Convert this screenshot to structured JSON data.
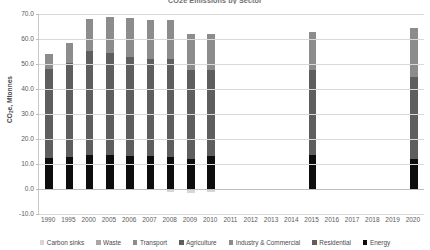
{
  "chart_data": {
    "type": "bar",
    "subtype": "stacked-column",
    "title": "CO2e Emissions by Sector",
    "xlabel": "",
    "ylabel": "CO₂e, Mtonnes",
    "ylim": [
      -10.0,
      70.0
    ],
    "ytick_step": 10.0,
    "ytick_labels": [
      "70.0",
      "60.0",
      "50.0",
      "40.0",
      "30.0",
      "20.0",
      "10.0",
      "0.0",
      "-10.0"
    ],
    "ytick_values": [
      70.0,
      60.0,
      50.0,
      40.0,
      30.0,
      20.0,
      10.0,
      0.0,
      -10.0
    ],
    "grid": true,
    "grid_axis": "y",
    "legend_position": "bottom",
    "categories": [
      "1990",
      "1995",
      "2000",
      "2005",
      "2006",
      "2007",
      "2008",
      "2009",
      "2010",
      "2011",
      "2012",
      "2013",
      "2014",
      "2015",
      "2016",
      "2017",
      "2018",
      "2019",
      "2020"
    ],
    "series": [
      {
        "name": "Energy",
        "color": "#0d0d0d",
        "values": [
          12.4,
          13.0,
          13.6,
          13.6,
          13.4,
          13.1,
          13.0,
          12.2,
          13.4,
          null,
          null,
          null,
          null,
          13.5,
          null,
          null,
          null,
          null,
          11.9
        ]
      },
      {
        "name": "Residential",
        "color": "#5e5e5e",
        "values": [
          35.6,
          37.3,
          41.8,
          40.9,
          39.6,
          38.9,
          38.9,
          35.4,
          34.3,
          null,
          null,
          null,
          null,
          34.3,
          null,
          null,
          null,
          null,
          33.0
        ]
      },
      {
        "name": "Industry & Commercial",
        "color": "#8c8c8c",
        "values": [
          6.2,
          8.1,
          12.7,
          14.4,
          15.4,
          15.7,
          15.7,
          14.5,
          14.4,
          null,
          null,
          null,
          null,
          15.0,
          null,
          null,
          null,
          null,
          19.4
        ]
      },
      {
        "name": "Agriculture",
        "color": "#5e5e5e",
        "values": [
          0,
          0,
          0,
          0,
          0,
          0,
          0,
          0,
          0,
          null,
          null,
          null,
          null,
          0,
          null,
          null,
          null,
          null,
          0
        ]
      },
      {
        "name": "Transport",
        "color": "#8c8c8c",
        "values": [
          0,
          0,
          0,
          0,
          0,
          0,
          0,
          0,
          0,
          null,
          null,
          null,
          null,
          0,
          null,
          null,
          null,
          null,
          0
        ]
      },
      {
        "name": "Waste",
        "color": "#a6a6a6",
        "values": [
          0,
          0,
          0,
          0,
          0,
          0,
          0,
          0,
          0,
          null,
          null,
          null,
          null,
          0,
          null,
          null,
          null,
          null,
          0
        ]
      },
      {
        "name": "Carbon sinks",
        "color": "#d6d6d6",
        "values": [
          0,
          0,
          0,
          0,
          0,
          0,
          -1.1,
          -1.4,
          -1.2,
          null,
          null,
          null,
          null,
          0,
          null,
          null,
          null,
          null,
          0
        ]
      }
    ],
    "totals": [
      54.2,
      58.4,
      68.1,
      68.9,
      68.4,
      67.7,
      67.6,
      62.1,
      62.1,
      null,
      null,
      null,
      null,
      62.8,
      null,
      null,
      null,
      null,
      64.3
    ]
  },
  "legend": {
    "items": [
      {
        "label": "Carbon sinks",
        "color": "#d6d6d6"
      },
      {
        "label": "Waste",
        "color": "#a6a6a6"
      },
      {
        "label": "Transport",
        "color": "#8c8c8c"
      },
      {
        "label": "Agriculture",
        "color": "#5e5e5e"
      },
      {
        "label": "Industry & Commercial",
        "color": "#8c8c8c"
      },
      {
        "label": "Residential",
        "color": "#5e5e5e"
      },
      {
        "label": "Energy",
        "color": "#0d0d0d"
      }
    ]
  },
  "colors": {
    "gridline": "#d9d9d9",
    "axis": "#bdbdbd",
    "text": "#5a5b5d",
    "background": "#ffffff"
  }
}
